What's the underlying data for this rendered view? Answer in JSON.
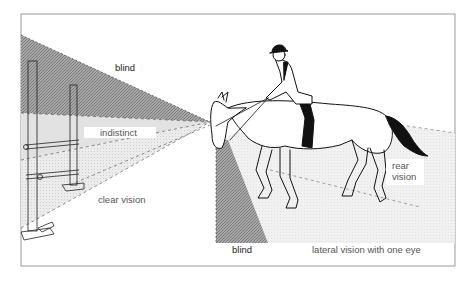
{
  "diagram": {
    "labels": {
      "blind_top": "blind",
      "indistinct": "indistinct",
      "clear_vision": "clear vision",
      "blind_bottom": "blind",
      "lateral": "lateral vision with one eye",
      "rear_line1": "rear",
      "rear_line2": "vision"
    },
    "zones": [
      {
        "name": "blind-upper",
        "shade": "dark hatched"
      },
      {
        "name": "indistinct",
        "shade": "light grey"
      },
      {
        "name": "clear-vision",
        "shade": "light dotted"
      },
      {
        "name": "blind-lower",
        "shade": "dark hatched"
      },
      {
        "name": "lateral-vision",
        "shade": "light dotted"
      }
    ],
    "colors": {
      "frame": "#9a9a9a",
      "dark_zone": "#8c8c8c",
      "light_zone": "#e4e4e4",
      "line": "#111111"
    }
  }
}
